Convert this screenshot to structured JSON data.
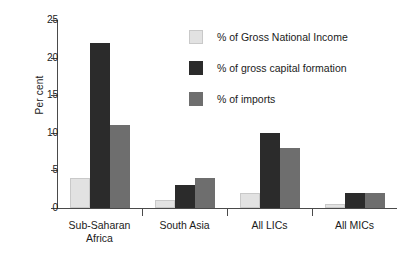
{
  "chart_data": {
    "type": "bar",
    "title": "",
    "xlabel": "",
    "ylabel": "Per cent",
    "ylim": [
      0,
      25
    ],
    "yticks": [
      0,
      5,
      10,
      15,
      20,
      25
    ],
    "ytick_labels": [
      "0",
      "5",
      "10",
      "15",
      "20",
      "25"
    ],
    "grid": false,
    "legend_position": "top-right",
    "categories": [
      "Sub-Saharan\nAfrica",
      "South Asia",
      "All LICs",
      "All MICs"
    ],
    "series": [
      {
        "name": "% of Gross National Income",
        "color": "#e2e2e2",
        "values": [
          4,
          1,
          2,
          0.5
        ]
      },
      {
        "name": "% of gross capital formation",
        "color": "#2b2b2b",
        "values": [
          22,
          3,
          10,
          2
        ]
      },
      {
        "name": "% of imports",
        "color": "#6e6e6e",
        "values": [
          11,
          4,
          8,
          2
        ]
      }
    ]
  }
}
